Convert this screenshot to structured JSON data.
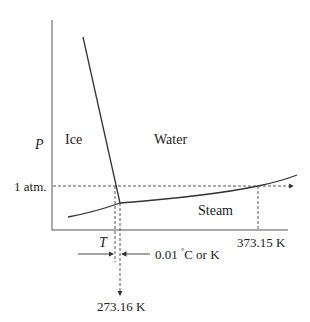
{
  "diagram": {
    "axes": {
      "y_label": "P",
      "x_label": "T"
    },
    "regions": {
      "solid": "Ice",
      "liquid": "Water",
      "vapor": "Steam"
    },
    "annotations": {
      "pressure_ref": "1 atm.",
      "boiling_point": "373.15 K",
      "triple_point_temp": "273.16 K",
      "gap_label": "0.01",
      "gap_unit_deg": "°",
      "gap_unit_text": "C or K"
    },
    "colors": {
      "line": "#333333",
      "background": "#ffffff"
    }
  }
}
